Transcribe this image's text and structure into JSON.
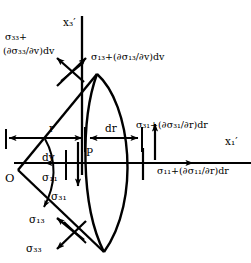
{
  "figure": {
    "colors": {
      "stroke": "#000000",
      "background": "#ffffff"
    },
    "axes": {
      "vertical": {
        "name": "x3-prime-axis",
        "label": "x₃′"
      },
      "horizontal": {
        "name": "x1-prime-axis",
        "label": "x₁′"
      }
    },
    "points": {
      "origin": "O",
      "element_point": "P"
    },
    "dimensions": {
      "radius": "r",
      "radius_increment": "dr",
      "angle_increment": "dv"
    },
    "stresses": {
      "top_normal": "σ₃₃+(∂σ₃₃/∂v)dv",
      "top_normal_line1": "σ₃₃+",
      "top_normal_line2": "(∂σ₃₃/∂v)dv",
      "top_shear": "σ₁₃+(∂σ₁₃/∂v)dv",
      "outer_shear": "σ₃₁+(∂σ₃₁/∂r)dr",
      "outer_normal": "σ₁₁+(∂σ₁₁/∂r)dr",
      "inner_normal": "σ₁₁",
      "inner_shear": "σ₃₁",
      "bottom_shear": "σ₁₃",
      "bottom_normal": "σ₃₃"
    }
  }
}
